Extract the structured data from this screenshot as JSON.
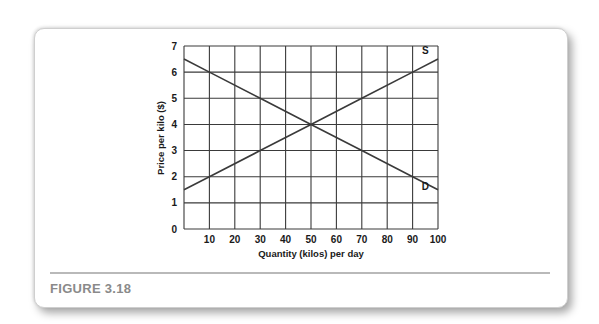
{
  "figure": {
    "label": "FIGURE 3.18"
  },
  "colors": {
    "grid": "#3a3a3a",
    "line": "#3a3a3a",
    "label_gray": "#8a8a8a"
  },
  "chart_data": {
    "type": "line",
    "title": "",
    "xlabel": "Quantity (kilos) per day",
    "ylabel": "Price per kilo ($)",
    "xlim": [
      0,
      100
    ],
    "ylim": [
      0,
      7
    ],
    "x_ticks": [
      "10",
      "20",
      "30",
      "40",
      "50",
      "60",
      "70",
      "80",
      "90",
      "100"
    ],
    "y_ticks": [
      "0",
      "1",
      "2",
      "3",
      "4",
      "5",
      "6",
      "7"
    ],
    "grid": true,
    "series": [
      {
        "name": "S",
        "x": [
          0,
          10,
          30,
          50,
          70,
          90,
          100
        ],
        "y": [
          1.5,
          2,
          3,
          4,
          5,
          6,
          6.5
        ]
      },
      {
        "name": "D",
        "x": [
          0,
          10,
          30,
          50,
          70,
          90,
          100
        ],
        "y": [
          6.5,
          6,
          5,
          4,
          3,
          2,
          1.5
        ]
      }
    ],
    "annotations": [
      {
        "text": "S",
        "x": 95,
        "y": 6.7
      },
      {
        "text": "D",
        "x": 95,
        "y": 1.5
      }
    ]
  }
}
